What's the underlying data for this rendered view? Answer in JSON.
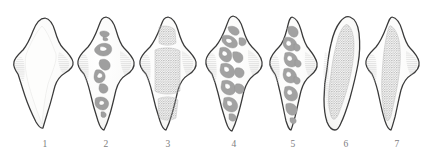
{
  "plate": {
    "title": "Specimen plate",
    "background_color": "#ffffff",
    "outline_color": "#3a3a3a",
    "body_fill_color": "#fbfbfa",
    "texture_color": "#a9a9a9",
    "hatch_color": "#bcbcbc",
    "label_color": "#7d7d7d",
    "width": 425,
    "height": 162
  },
  "figures": [
    {
      "label": "1",
      "label_x": 33,
      "center_x": 45,
      "description": "blank pale body with lateral lobes and fine horizontal hatching, no internal granular mass",
      "texture": "none",
      "outline": "lobed-ovate",
      "width": 62,
      "height": 112
    },
    {
      "label": "2",
      "label_x": 94,
      "center_x": 106,
      "description": "chain of scattered irregular grey blobs along the vertical axis",
      "texture": "scattered-blobs",
      "outline": "lobed-ovate",
      "width": 58,
      "height": 112
    },
    {
      "label": "3",
      "label_x": 156,
      "center_x": 168,
      "description": "two dense granular rectangular patches, upper and lower",
      "texture": "two-granular-blocks",
      "outline": "lobed-ovate",
      "width": 58,
      "height": 112
    },
    {
      "label": "4",
      "label_x": 222,
      "center_x": 234,
      "description": "branching zigzag grey structures filling the body",
      "texture": "branching-zigzag",
      "outline": "lobed-ovate",
      "width": 60,
      "height": 114
    },
    {
      "label": "5",
      "label_x": 281,
      "center_x": 293,
      "description": "narrow central branching chain along the axis",
      "texture": "central-chain",
      "outline": "narrow-lobed",
      "width": 52,
      "height": 112
    },
    {
      "label": "6",
      "label_x": 334,
      "center_x": 346,
      "description": "smooth teardrop with large dense stippled interior mass",
      "texture": "dense-stipple",
      "outline": "smooth-teardrop",
      "width": 48,
      "height": 112
    },
    {
      "label": "7",
      "label_x": 385,
      "center_x": 392,
      "description": "lobed body with dense stippled elongate interior mass",
      "texture": "dense-stipple",
      "outline": "lobed-ovate",
      "width": 58,
      "height": 112
    }
  ]
}
